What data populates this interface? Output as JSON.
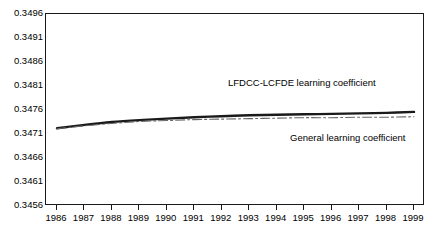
{
  "chart_data": {
    "type": "line",
    "title": "",
    "xlabel": "",
    "ylabel": "",
    "grid": false,
    "legend_position": "inline-annotations",
    "x": [
      1986,
      1987,
      1988,
      1989,
      1990,
      1991,
      1992,
      1993,
      1994,
      1995,
      1996,
      1997,
      1998,
      1999
    ],
    "categories": [
      "1986",
      "1987",
      "1988",
      "1989",
      "1990",
      "1991",
      "1992",
      "1993",
      "1994",
      "1995",
      "1996",
      "1997",
      "1998",
      "1999"
    ],
    "xlim": [
      1985.6,
      1999.4
    ],
    "ylim": [
      0.3456,
      0.3496
    ],
    "ytick_labels": [
      "0.3496",
      "0.3491",
      "0.3486",
      "0.3481",
      "0.3476",
      "0.3471",
      "0.3466",
      "0.3461",
      "0.3456"
    ],
    "ytick_values": [
      0.3496,
      0.3491,
      0.3486,
      0.3481,
      0.3476,
      0.3471,
      0.3466,
      0.3461,
      0.3456
    ],
    "series": [
      {
        "name": "LFDCC-LCFDE learning coefficient",
        "style": "solid",
        "color": "#1a1a1a",
        "values": [
          0.34722,
          0.34729,
          0.34735,
          0.34739,
          0.34742,
          0.34745,
          0.34747,
          0.34749,
          0.3475,
          0.34751,
          0.34752,
          0.34753,
          0.34754,
          0.34756
        ]
      },
      {
        "name": "General learning coefficient",
        "style": "dash-dot",
        "color": "#666666",
        "values": [
          0.34721,
          0.34727,
          0.34732,
          0.34736,
          0.34738,
          0.3474,
          0.34741,
          0.34742,
          0.34743,
          0.34744,
          0.34744,
          0.34745,
          0.34745,
          0.34746
        ]
      }
    ],
    "annotations": [
      {
        "text": "LFDCC-LCFDE learning coefficient",
        "series": "LFDCC-LCFDE learning coefficient"
      },
      {
        "text": "General learning coefficient",
        "series": "General learning coefficient"
      }
    ]
  }
}
